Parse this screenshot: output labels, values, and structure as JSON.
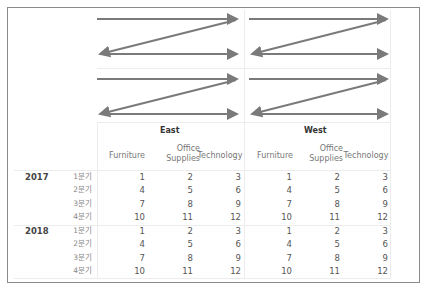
{
  "diagram": {
    "arrow_color": "#7a7a7a",
    "panes": [
      "East",
      "West"
    ]
  },
  "table": {
    "regions": [
      {
        "label": "East",
        "columns": [
          "Furniture",
          "Office Supplies",
          "Technology"
        ]
      },
      {
        "label": "West",
        "columns": [
          "Furniture",
          "Office Supplies",
          "Technology"
        ]
      }
    ],
    "subheaders": {
      "furniture": "Furniture",
      "office_line1": "Office",
      "office_line2": "Supplies",
      "technology": "Technology"
    },
    "years": [
      {
        "year": "2017",
        "quarters": [
          {
            "label": "1분기",
            "east": [
              "1",
              "2",
              "3"
            ],
            "west": [
              "1",
              "2",
              "3"
            ]
          },
          {
            "label": "2분기",
            "east": [
              "4",
              "5",
              "6"
            ],
            "west": [
              "4",
              "5",
              "6"
            ]
          },
          {
            "label": "3분기",
            "east": [
              "7",
              "8",
              "9"
            ],
            "west": [
              "7",
              "8",
              "9"
            ]
          },
          {
            "label": "4분기",
            "east": [
              "10",
              "11",
              "12"
            ],
            "west": [
              "10",
              "11",
              "12"
            ]
          }
        ]
      },
      {
        "year": "2018",
        "quarters": [
          {
            "label": "1분기",
            "east": [
              "1",
              "2",
              "3"
            ],
            "west": [
              "1",
              "2",
              "3"
            ]
          },
          {
            "label": "2분기",
            "east": [
              "4",
              "5",
              "6"
            ],
            "west": [
              "4",
              "5",
              "6"
            ]
          },
          {
            "label": "3분기",
            "east": [
              "7",
              "8",
              "9"
            ],
            "west": [
              "7",
              "8",
              "9"
            ]
          },
          {
            "label": "4분기",
            "east": [
              "10",
              "11",
              "12"
            ],
            "west": [
              "10",
              "11",
              "12"
            ]
          }
        ]
      }
    ]
  }
}
